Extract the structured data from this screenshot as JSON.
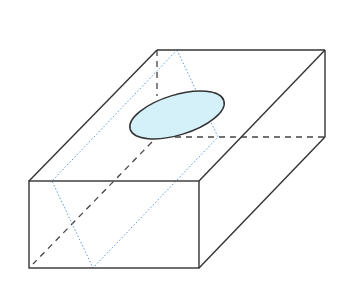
{
  "diagram": {
    "type": "geometry-3d-box",
    "colors": {
      "edge": "#333333",
      "hidden_edge": "#444444",
      "plane": "#5b9bd5",
      "ellipse_fill": "#d4f0f8",
      "ellipse_stroke": "#333333"
    },
    "vertices": {
      "front_top_left": [
        29,
        181
      ],
      "front_top_right": [
        199,
        181
      ],
      "front_bottom_left": [
        29,
        268
      ],
      "front_bottom_right": [
        199,
        268
      ],
      "back_top_left": [
        157,
        50
      ],
      "back_top_right": [
        325,
        50
      ],
      "back_bottom_right": [
        325,
        137
      ],
      "back_bottom_left_hidden": [
        157,
        137
      ]
    },
    "plane_vertices": [
      [
        177,
        50
      ],
      [
        52,
        181
      ],
      [
        93,
        268
      ],
      [
        218,
        137
      ]
    ],
    "ellipse": {
      "cx": 177,
      "cy": 115,
      "rx": 49,
      "ry": 20,
      "rotation": -17
    }
  }
}
